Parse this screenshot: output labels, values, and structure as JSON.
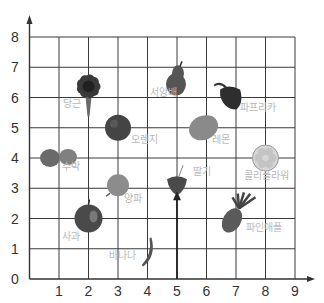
{
  "chart_data": {
    "type": "scatter",
    "title": "",
    "xlabel": "",
    "ylabel": "",
    "xlim": [
      0,
      9
    ],
    "ylim": [
      0,
      8
    ],
    "grid": true,
    "x_ticks": [
      "1",
      "2",
      "3",
      "4",
      "5",
      "6",
      "7",
      "8",
      "9"
    ],
    "y_ticks": [
      "0",
      "1",
      "2",
      "3",
      "4",
      "5",
      "6",
      "7",
      "8"
    ],
    "annotation": {
      "type": "arrow",
      "from": [
        5,
        0
      ],
      "to": [
        5,
        2.9
      ],
      "target": "딸기"
    },
    "points": [
      {
        "label": "당근",
        "icon": "carrot",
        "x": 2,
        "y": 6.3,
        "lx": 1.45,
        "ly": 5.7,
        "color": "#3a3a3a"
      },
      {
        "label": "서양배",
        "icon": "pear",
        "x": 5,
        "y": 6.6,
        "lx": 4.55,
        "ly": 6.05,
        "color": "#555555"
      },
      {
        "label": "파프리카",
        "icon": "paprika",
        "x": 6.8,
        "y": 6.0,
        "lx": 7.75,
        "ly": 5.55,
        "color": "#2e2e2e"
      },
      {
        "label": "오렌지",
        "icon": "orange",
        "x": 3,
        "y": 5.0,
        "lx": 3.9,
        "ly": 4.5,
        "color": "#444444"
      },
      {
        "label": "레몬",
        "icon": "lemon",
        "x": 5.9,
        "y": 5.0,
        "lx": 6.5,
        "ly": 4.5,
        "color": "#8a8a8a"
      },
      {
        "label": "수박",
        "icon": "watermelon",
        "x": 1,
        "y": 4.0,
        "lx": 1.4,
        "ly": 3.6,
        "color": "#6a6a6a"
      },
      {
        "label": "콜리플라워",
        "icon": "cauliflower",
        "x": 8,
        "y": 4.0,
        "lx": 8.05,
        "ly": 3.3,
        "color": "#b0b0b0"
      },
      {
        "label": "딸기",
        "icon": "strawberry",
        "x": 5,
        "y": 3.1,
        "lx": 5.85,
        "ly": 3.45,
        "color": "#4a4a4a"
      },
      {
        "label": "양파",
        "icon": "onion",
        "x": 3,
        "y": 3.1,
        "lx": 3.5,
        "ly": 2.55,
        "color": "#8c8c8c"
      },
      {
        "label": "사과",
        "icon": "apple",
        "x": 2,
        "y": 2.0,
        "lx": 1.4,
        "ly": 1.3,
        "color": "#4a4a4a"
      },
      {
        "label": "파인애플",
        "icon": "pineapple",
        "x": 7,
        "y": 2.2,
        "lx": 7.95,
        "ly": 1.6,
        "color": "#5a5a5a"
      },
      {
        "label": "바나나",
        "icon": "banana",
        "x": 4,
        "y": 0.9,
        "lx": 3.15,
        "ly": 0.65,
        "color": "#777777"
      }
    ]
  },
  "colors": {
    "grid": "#3a3a3a",
    "axis": "#333333",
    "label": "#b8b8b8"
  }
}
